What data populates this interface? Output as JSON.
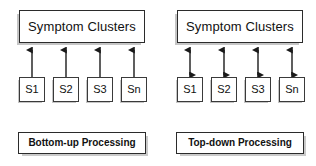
{
  "figure": {
    "background_color": "#ffffff",
    "stroke_color": "#2b2b2b",
    "shadow_color": "#969696"
  },
  "panels": [
    {
      "id": "bottom-up",
      "cluster_label": "Symptom Clusters",
      "nodes": [
        {
          "label": "S1"
        },
        {
          "label": "S2"
        },
        {
          "label": "S3"
        },
        {
          "label": "Sn"
        }
      ],
      "arrow_direction": "up",
      "caption": "Bottom-up Processing"
    },
    {
      "id": "top-down",
      "cluster_label": "Symptom Clusters",
      "nodes": [
        {
          "label": "S1"
        },
        {
          "label": "S2"
        },
        {
          "label": "S3"
        },
        {
          "label": "Sn"
        }
      ],
      "arrow_direction": "both",
      "caption": "Top-down Processing"
    }
  ]
}
